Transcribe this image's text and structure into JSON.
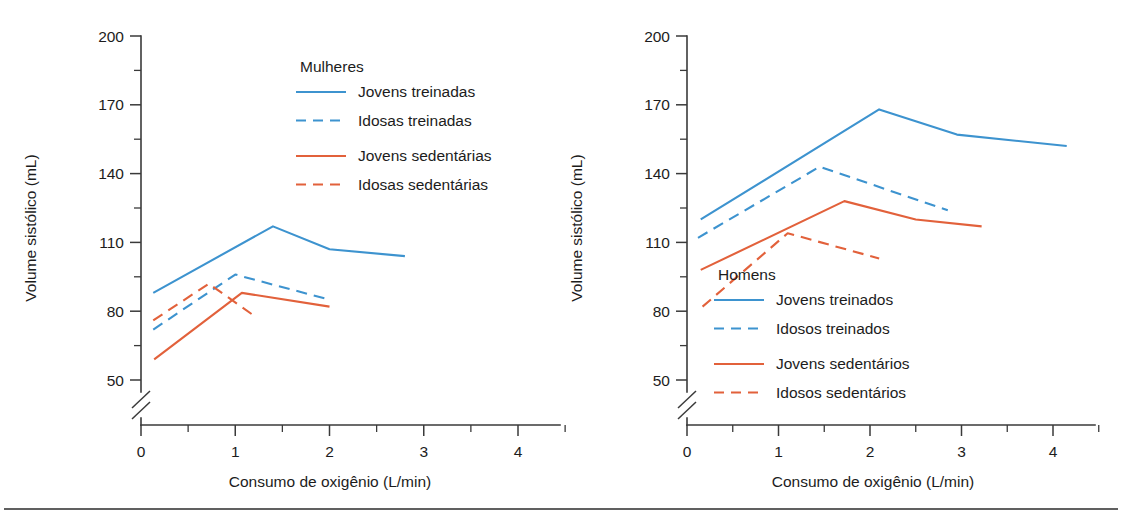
{
  "figure": {
    "background_color": "#ffffff",
    "rule_color": "#2b2b2b",
    "axis_color": "#3a3a3a",
    "text_color": "#1c1c1c"
  },
  "colors": {
    "blue": "#3d93cf",
    "orange": "#e2613b"
  },
  "chart_data": [
    {
      "type": "line",
      "panel_id": "women",
      "title": "Mulheres",
      "xlabel": "Consumo de oxigênio (L/min)",
      "ylabel": "Volume sistólico (mL)",
      "xlim": [
        -0.35,
        4.45
      ],
      "ylim": [
        40,
        200
      ],
      "xticks": [
        0,
        1,
        2,
        3,
        4
      ],
      "xtick_labels": [
        "0",
        "1",
        "2",
        "3",
        "4"
      ],
      "xminor_ticks": [
        0.5,
        1.5,
        2.5,
        3.5
      ],
      "yticks": [
        50,
        80,
        110,
        140,
        170,
        200
      ],
      "ytick_labels": [
        "50",
        "80",
        "110",
        "140",
        "170",
        "200"
      ],
      "yminor_ticks": [
        65,
        95,
        125,
        155,
        185
      ],
      "y_axis_break": true,
      "grid": false,
      "legend_position": "upper-center",
      "series": [
        {
          "name": "Jovens treinadas",
          "color": "#3d93cf",
          "style": "solid",
          "x": [
            0.13,
            1.4,
            2.0,
            2.8
          ],
          "y": [
            88,
            117,
            107,
            104
          ]
        },
        {
          "name": "Idosas treinadas",
          "color": "#3d93cf",
          "style": "dashed",
          "x": [
            0.13,
            1.0,
            2.0
          ],
          "y": [
            72,
            96,
            85
          ]
        },
        {
          "name": "Jovens sedentárias",
          "color": "#e2613b",
          "style": "solid",
          "x": [
            0.14,
            1.07,
            2.0
          ],
          "y": [
            59,
            88,
            82
          ]
        },
        {
          "name": "Idosas sedentárias",
          "color": "#e2613b",
          "style": "dashed",
          "x": [
            0.13,
            0.72,
            1.2
          ],
          "y": [
            76,
            92,
            78
          ]
        }
      ]
    },
    {
      "type": "line",
      "panel_id": "men",
      "title": "Homens",
      "xlabel": "Consumo de oxigênio (L/min)",
      "ylabel": "Volume sistólico (mL)",
      "xlim": [
        -0.35,
        4.45
      ],
      "ylim": [
        40,
        200
      ],
      "xticks": [
        0,
        1,
        2,
        3,
        4
      ],
      "xtick_labels": [
        "0",
        "1",
        "2",
        "3",
        "4"
      ],
      "xminor_ticks": [
        0.5,
        1.5,
        2.5,
        3.5
      ],
      "yticks": [
        50,
        80,
        110,
        140,
        170,
        200
      ],
      "ytick_labels": [
        "50",
        "80",
        "110",
        "140",
        "170",
        "200"
      ],
      "yminor_ticks": [
        65,
        95,
        125,
        155,
        185
      ],
      "y_axis_break": true,
      "grid": false,
      "legend_position": "lower-right",
      "series": [
        {
          "name": "Jovens treinados",
          "color": "#3d93cf",
          "style": "solid",
          "x": [
            0.15,
            2.1,
            2.95,
            4.15
          ],
          "y": [
            120,
            168,
            157,
            152
          ]
        },
        {
          "name": "Idosos treinados",
          "color": "#3d93cf",
          "style": "dashed",
          "x": [
            0.12,
            1.45,
            2.85
          ],
          "y": [
            112,
            143,
            124
          ]
        },
        {
          "name": "Jovens sedentários",
          "color": "#e2613b",
          "style": "solid",
          "x": [
            0.15,
            1.72,
            2.5,
            3.22
          ],
          "y": [
            98,
            128,
            120,
            117
          ]
        },
        {
          "name": "Idosos sedentários",
          "color": "#e2613b",
          "style": "dashed",
          "x": [
            0.17,
            1.1,
            2.1
          ],
          "y": [
            82,
            114,
            103
          ]
        }
      ]
    }
  ]
}
